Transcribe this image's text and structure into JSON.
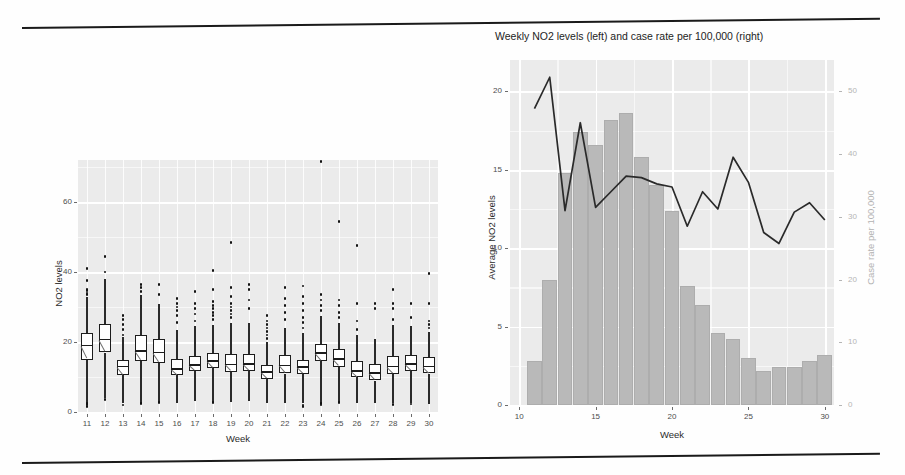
{
  "document": {
    "type": "scanned-figure-page",
    "rule_color": "#1a1a1a"
  },
  "left_chart": {
    "y_axis_title": "NO2 levels",
    "x_axis_title": "Week",
    "y_ticks": [
      "0",
      "20",
      "40",
      "60"
    ],
    "x_ticks": [
      "11",
      "12",
      "13",
      "14",
      "15",
      "16",
      "17",
      "18",
      "19",
      "20",
      "21",
      "22",
      "23",
      "24",
      "25",
      "26",
      "27",
      "28",
      "29",
      "30"
    ]
  },
  "right_chart": {
    "title": "Weekly NO2 levels (left) and case rate per 100,000 (right)",
    "y_axis_title_left": "Average NO2 levels",
    "y_axis_title_right": "Case rate per 100,000",
    "x_axis_title": "Week",
    "y_ticks_left": [
      "0",
      "5",
      "10",
      "15",
      "20"
    ],
    "y_ticks_right": [
      "0",
      "10",
      "20",
      "30",
      "40",
      "50"
    ],
    "x_ticks": [
      "10",
      "15",
      "20",
      "25",
      "30"
    ]
  },
  "chart_data": [
    {
      "type": "box",
      "title": "",
      "xlabel": "Week",
      "ylabel": "NO2 levels",
      "ylim": [
        0,
        72
      ],
      "grid": true,
      "notched": true,
      "categories": [
        "11",
        "12",
        "13",
        "14",
        "15",
        "16",
        "17",
        "18",
        "19",
        "20",
        "21",
        "22",
        "23",
        "24",
        "25",
        "26",
        "27",
        "28",
        "29",
        "30"
      ],
      "boxes": [
        {
          "week": "11",
          "whisker_low": 2.0,
          "q1": 15.0,
          "median": 19.0,
          "q3": 22.5,
          "whisker_high": 33.0,
          "outliers": [
            33.5,
            34.0,
            34.6,
            35.0,
            37.5,
            41.0,
            2.5,
            2.0,
            1.6
          ]
        },
        {
          "week": "12",
          "whisker_low": 4.0,
          "q1": 17.0,
          "median": 20.7,
          "q3": 25.2,
          "whisker_high": 38.0,
          "outliers": [
            40.0,
            44.5,
            3.5
          ]
        },
        {
          "week": "13",
          "whisker_low": 2.6,
          "q1": 10.5,
          "median": 13.0,
          "q3": 15.0,
          "whisker_high": 21.5,
          "outliers": [
            22.0,
            23.5,
            25.0,
            26.5,
            27.5,
            2.0
          ]
        },
        {
          "week": "14",
          "whisker_low": 2.6,
          "q1": 14.5,
          "median": 17.5,
          "q3": 22.0,
          "whisker_high": 33.5,
          "outliers": [
            34.5,
            35.5,
            36.5,
            2.5
          ]
        },
        {
          "week": "15",
          "whisker_low": 3.0,
          "q1": 14.0,
          "median": 17.0,
          "q3": 21.0,
          "whisker_high": 31.0,
          "outliers": [
            33.5,
            36.5,
            2.8
          ]
        },
        {
          "week": "16",
          "whisker_low": 2.5,
          "q1": 10.5,
          "median": 12.3,
          "q3": 15.2,
          "whisker_high": 23.5,
          "outliers": [
            25.5,
            27.5,
            29.0,
            30.0,
            31.0,
            32.5
          ]
        },
        {
          "week": "17",
          "whisker_low": 3.0,
          "q1": 11.8,
          "median": 13.5,
          "q3": 16.0,
          "whisker_high": 24.5,
          "outliers": [
            26.0,
            28.0,
            29.5,
            31.0,
            34.5
          ]
        },
        {
          "week": "18",
          "whisker_low": 3.0,
          "q1": 12.5,
          "median": 14.6,
          "q3": 17.0,
          "whisker_high": 25.0,
          "outliers": [
            26.5,
            27.5,
            28.5,
            29.5,
            30.5,
            31.5,
            35.0,
            40.5,
            2.6
          ]
        },
        {
          "week": "19",
          "whisker_low": 2.8,
          "q1": 11.5,
          "median": 13.6,
          "q3": 16.5,
          "whisker_high": 25.5,
          "outliers": [
            27.0,
            28.0,
            29.0,
            30.0,
            31.0,
            33.0,
            35.5,
            48.5
          ]
        },
        {
          "week": "20",
          "whisker_low": 3.0,
          "q1": 11.8,
          "median": 13.8,
          "q3": 16.5,
          "whisker_high": 25.5,
          "outliers": [
            29.5,
            32.0,
            35.0,
            36.5
          ]
        },
        {
          "week": "21",
          "whisker_low": 2.5,
          "q1": 9.5,
          "median": 11.5,
          "q3": 13.5,
          "whisker_high": 20.0,
          "outliers": [
            21.0,
            22.0,
            23.0,
            24.0,
            25.0,
            26.0,
            27.5
          ]
        },
        {
          "week": "22",
          "whisker_low": 2.5,
          "q1": 11.0,
          "median": 13.3,
          "q3": 16.2,
          "whisker_high": 24.0,
          "outliers": [
            26.5,
            28.5,
            30.5,
            32.5,
            35.5
          ]
        },
        {
          "week": "23",
          "whisker_low": 2.5,
          "q1": 10.8,
          "median": 12.8,
          "q3": 15.0,
          "whisker_high": 22.5,
          "outliers": [
            24.0,
            25.5,
            27.0,
            29.0,
            31.0,
            33.0,
            36.0,
            2.0,
            1.6
          ]
        },
        {
          "week": "24",
          "whisker_low": 2.6,
          "q1": 14.5,
          "median": 16.8,
          "q3": 19.5,
          "whisker_high": 27.5,
          "outliers": [
            29.0,
            30.5,
            32.0,
            33.5,
            71.5,
            2.5,
            2.0
          ]
        },
        {
          "week": "25",
          "whisker_low": 2.6,
          "q1": 13.0,
          "median": 15.2,
          "q3": 18.0,
          "whisker_high": 25.5,
          "outliers": [
            27.0,
            28.5,
            30.5,
            32.0,
            54.5,
            2.6
          ]
        },
        {
          "week": "26",
          "whisker_low": 2.6,
          "q1": 10.0,
          "median": 11.8,
          "q3": 14.5,
          "whisker_high": 22.0,
          "outliers": [
            23.5,
            26.0,
            31.0,
            47.5
          ]
        },
        {
          "week": "27",
          "whisker_low": 2.6,
          "q1": 9.0,
          "median": 11.2,
          "q3": 13.8,
          "whisker_high": 21.0,
          "outliers": [
            29.5,
            31.0
          ]
        },
        {
          "week": "28",
          "whisker_low": 2.6,
          "q1": 11.0,
          "median": 13.0,
          "q3": 16.0,
          "whisker_high": 25.0,
          "outliers": [
            26.5,
            29.5,
            31.0,
            35.0,
            2.2
          ]
        },
        {
          "week": "29",
          "whisker_low": 2.5,
          "q1": 11.8,
          "median": 13.8,
          "q3": 16.2,
          "whisker_high": 24.5,
          "outliers": [
            27.0,
            31.0,
            2.3
          ]
        },
        {
          "week": "30",
          "whisker_low": 2.2,
          "q1": 11.0,
          "median": 13.0,
          "q3": 15.8,
          "whisker_high": 23.0,
          "outliers": [
            24.0,
            25.0,
            26.0,
            31.0,
            39.5
          ]
        }
      ]
    },
    {
      "type": "bar",
      "title": "Weekly NO2 levels (left) and case rate per 100,000 (right)",
      "xlabel": "Week",
      "ylabel": "Average NO2 levels",
      "ylabel_right": "Case rate per 100,000",
      "ylim": [
        0,
        22
      ],
      "ylim_right": [
        0,
        55
      ],
      "grid": true,
      "legend": "none",
      "x": [
        11,
        12,
        13,
        14,
        15,
        16,
        17,
        18,
        19,
        20,
        21,
        22,
        23,
        24,
        25,
        26,
        27,
        28,
        29,
        30
      ],
      "series": [
        {
          "name": "Case rate per 100,000",
          "kind": "bar",
          "axis": "right",
          "values": [
            7.0,
            20.0,
            37.0,
            43.5,
            41.5,
            45.5,
            46.5,
            39.5,
            35.0,
            31.0,
            19.0,
            16.0,
            11.5,
            10.5,
            7.5,
            5.5,
            6.0,
            6.0,
            7.0,
            8.0
          ]
        },
        {
          "name": "Average NO2 levels",
          "kind": "line",
          "axis": "left",
          "values": [
            18.9,
            20.9,
            12.4,
            18.0,
            12.6,
            13.6,
            14.6,
            14.5,
            14.1,
            13.9,
            11.4,
            13.6,
            12.5,
            15.8,
            14.2,
            11.0,
            10.3,
            12.3,
            12.9,
            11.8
          ]
        }
      ]
    }
  ]
}
